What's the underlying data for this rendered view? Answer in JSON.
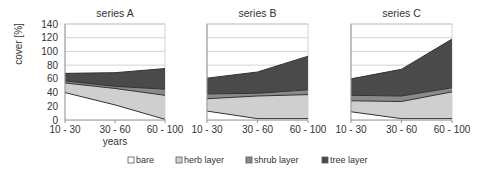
{
  "chart_data": [
    {
      "type": "area",
      "stacked": true,
      "title": "series A",
      "categories": [
        "10 - 30",
        "30 - 60",
        "60 - 100"
      ],
      "xlabel": "years",
      "ylabel": "cover [%]",
      "ylim": [
        0,
        140
      ],
      "yticks": [
        0,
        20,
        40,
        60,
        80,
        100,
        120,
        140
      ],
      "grid": true,
      "series": [
        {
          "name": "bare",
          "values": [
            40,
            22,
            1
          ]
        },
        {
          "name": "herb layer",
          "values": [
            14,
            24,
            35
          ]
        },
        {
          "name": "shrub layer",
          "values": [
            3,
            3,
            9
          ]
        },
        {
          "name": "tree layer",
          "values": [
            11,
            20,
            30
          ]
        }
      ]
    },
    {
      "type": "area",
      "stacked": true,
      "title": "series B",
      "categories": [
        "10 - 30",
        "30 - 60",
        "60 - 100"
      ],
      "xlabel": "years",
      "ylim": [
        0,
        140
      ],
      "grid": true,
      "series": [
        {
          "name": "bare",
          "values": [
            13,
            2,
            2
          ]
        },
        {
          "name": "herb layer",
          "values": [
            18,
            33,
            35
          ]
        },
        {
          "name": "shrub layer",
          "values": [
            7,
            4,
            7
          ]
        },
        {
          "name": "tree layer",
          "values": [
            23,
            31,
            49
          ]
        }
      ]
    },
    {
      "type": "area",
      "stacked": true,
      "title": "series C",
      "categories": [
        "10 - 30",
        "30 - 60",
        "60 - 100"
      ],
      "xlabel": "years",
      "ylim": [
        0,
        140
      ],
      "grid": true,
      "series": [
        {
          "name": "bare",
          "values": [
            12,
            2,
            2
          ]
        },
        {
          "name": "herb layer",
          "values": [
            16,
            25,
            39
          ]
        },
        {
          "name": "shrub layer",
          "values": [
            8,
            8,
            6
          ]
        },
        {
          "name": "tree layer",
          "values": [
            24,
            39,
            71
          ]
        }
      ]
    }
  ],
  "legend": {
    "position": "bottom",
    "items": [
      {
        "name": "bare",
        "color": "#ffffff"
      },
      {
        "name": "herb layer",
        "color": "#cfcfcf"
      },
      {
        "name": "shrub layer",
        "color": "#8a8a8a"
      },
      {
        "name": "tree layer",
        "color": "#4a4a4a"
      }
    ]
  },
  "colors": {
    "bare": "#ffffff",
    "herb": "#cfcfcf",
    "shrub": "#8a8a8a",
    "tree": "#4a4a4a",
    "line": "#333333",
    "grid": "#c8c8c8",
    "axis": "#999999"
  },
  "labels": {
    "ylabel": "cover [%]",
    "xlabel": "years"
  }
}
